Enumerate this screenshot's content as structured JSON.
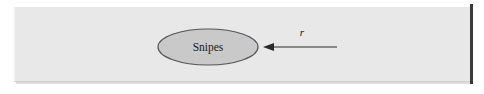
{
  "figure": {
    "width": 484,
    "height": 94,
    "background_color": "#ffffff",
    "panel": {
      "background_color": "#e8e8e9",
      "x": 14,
      "y": 7,
      "width": 457,
      "height": 75
    },
    "right_rule": {
      "color": "#3a3a3c",
      "x": 470,
      "y": 4,
      "width": 3,
      "height": 80
    }
  },
  "diagram": {
    "nodes": [
      {
        "id": "snipes",
        "label": "Snipes",
        "shape": "ellipse",
        "cx": 208,
        "cy": 47,
        "rx": 50,
        "ry": 18,
        "fill_color": "#c9c9ca",
        "stroke_color": "#54545a"
      }
    ],
    "edges": [
      {
        "id": "r-arrow",
        "label": "r",
        "label_style": "italic",
        "direction": "left",
        "from_x": 337,
        "to_x": 264,
        "y": 47,
        "target": "snipes",
        "color": "#2a2a2c",
        "label_x": 302,
        "label_y": 36
      }
    ]
  }
}
